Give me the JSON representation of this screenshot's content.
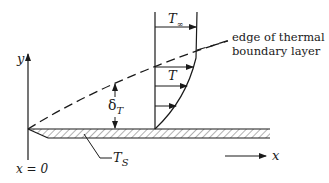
{
  "diagram": {
    "labels": {
      "y_axis": "y",
      "x_axis": "x",
      "origin": "x = 0",
      "free_stream_temp": "T",
      "free_stream_temp_sub": "∞",
      "local_temp": "T",
      "thickness": "δ",
      "thickness_sub": "T",
      "surface_temp": "T",
      "surface_temp_sub": "S",
      "boundary_edge_line1": "edge of thermal",
      "boundary_edge_line2": "boundary layer"
    },
    "colors": {
      "ink": "#1a1a1a",
      "background": "#ffffff"
    }
  }
}
